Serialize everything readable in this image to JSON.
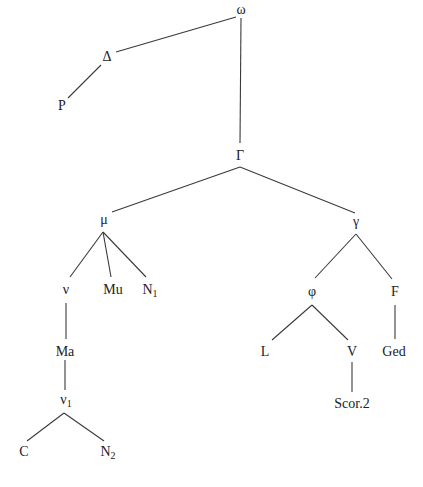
{
  "diagram": {
    "type": "stemma-tree",
    "nodes": [
      {
        "id": "omega",
        "label": "ω",
        "sub": "",
        "x": 241,
        "y": 10
      },
      {
        "id": "Delta",
        "label": "Δ",
        "sub": "",
        "x": 107,
        "y": 57
      },
      {
        "id": "P",
        "label": "P",
        "sub": "",
        "x": 62,
        "y": 106
      },
      {
        "id": "Gamma",
        "label": "Γ",
        "sub": "",
        "x": 240,
        "y": 156
      },
      {
        "id": "mu",
        "label": "μ",
        "sub": "",
        "x": 104,
        "y": 220
      },
      {
        "id": "gamma",
        "label": "γ",
        "sub": "",
        "x": 356,
        "y": 222
      },
      {
        "id": "nu",
        "label": "ν",
        "sub": "",
        "x": 66,
        "y": 290
      },
      {
        "id": "Mu",
        "label": "Mu",
        "sub": "",
        "x": 113,
        "y": 290
      },
      {
        "id": "N1",
        "label": "N",
        "sub": "1",
        "x": 150,
        "y": 291
      },
      {
        "id": "phi",
        "label": "φ",
        "sub": "",
        "x": 312,
        "y": 292
      },
      {
        "id": "F",
        "label": "F",
        "sub": "",
        "x": 395,
        "y": 292
      },
      {
        "id": "Ma",
        "label": "Ma",
        "sub": "",
        "x": 65,
        "y": 352
      },
      {
        "id": "L",
        "label": "L",
        "sub": "",
        "x": 265,
        "y": 352
      },
      {
        "id": "V",
        "label": "V",
        "sub": "",
        "x": 352,
        "y": 352
      },
      {
        "id": "Ged",
        "label": "Ged",
        "sub": "",
        "x": 394,
        "y": 352
      },
      {
        "id": "nu1",
        "label": "ν",
        "sub": "1",
        "x": 66,
        "y": 401
      },
      {
        "id": "Scor2",
        "label": "Scor.2",
        "sub": "",
        "x": 352,
        "y": 404
      },
      {
        "id": "C",
        "label": "C",
        "sub": "",
        "x": 24,
        "y": 452
      },
      {
        "id": "N2",
        "label": "N",
        "sub": "2",
        "x": 108,
        "y": 453
      }
    ],
    "edges": [
      {
        "from": "omega",
        "to": "Delta",
        "x1": 236,
        "y1": 17,
        "x2": 116,
        "y2": 52
      },
      {
        "from": "omega",
        "to": "Gamma",
        "x1": 241,
        "y1": 18,
        "x2": 240,
        "y2": 143
      },
      {
        "from": "Delta",
        "to": "P",
        "x1": 101,
        "y1": 65,
        "x2": 68,
        "y2": 98
      },
      {
        "from": "Gamma",
        "to": "mu",
        "x1": 240,
        "y1": 167,
        "x2": 112,
        "y2": 212
      },
      {
        "from": "Gamma",
        "to": "gamma",
        "x1": 240,
        "y1": 167,
        "x2": 355,
        "y2": 213
      },
      {
        "from": "mu",
        "to": "nu",
        "x1": 103,
        "y1": 232,
        "x2": 70,
        "y2": 277
      },
      {
        "from": "mu",
        "to": "Mu",
        "x1": 103,
        "y1": 232,
        "x2": 111,
        "y2": 277
      },
      {
        "from": "mu",
        "to": "N1",
        "x1": 103,
        "y1": 232,
        "x2": 146,
        "y2": 277
      },
      {
        "from": "gamma",
        "to": "phi",
        "x1": 356,
        "y1": 234,
        "x2": 315,
        "y2": 278
      },
      {
        "from": "gamma",
        "to": "F",
        "x1": 356,
        "y1": 234,
        "x2": 392,
        "y2": 279
      },
      {
        "from": "nu",
        "to": "Ma",
        "x1": 66,
        "y1": 303,
        "x2": 66,
        "y2": 339
      },
      {
        "from": "phi",
        "to": "L",
        "x1": 312,
        "y1": 305,
        "x2": 272,
        "y2": 340
      },
      {
        "from": "phi",
        "to": "V",
        "x1": 312,
        "y1": 305,
        "x2": 348,
        "y2": 340
      },
      {
        "from": "F",
        "to": "Ged",
        "x1": 395,
        "y1": 305,
        "x2": 395,
        "y2": 339
      },
      {
        "from": "Ma",
        "to": "nu1",
        "x1": 65,
        "y1": 360,
        "x2": 65,
        "y2": 390
      },
      {
        "from": "V",
        "to": "Scor2",
        "x1": 352,
        "y1": 362,
        "x2": 352,
        "y2": 392
      },
      {
        "from": "nu1",
        "to": "C",
        "x1": 64,
        "y1": 413,
        "x2": 27,
        "y2": 441
      },
      {
        "from": "nu1",
        "to": "N2",
        "x1": 64,
        "y1": 413,
        "x2": 104,
        "y2": 441
      }
    ]
  }
}
